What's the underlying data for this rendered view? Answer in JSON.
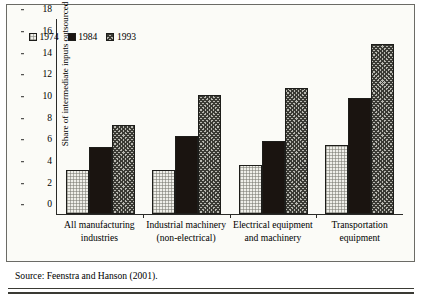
{
  "chart_data": {
    "type": "bar",
    "title": "",
    "subtitle": "",
    "xlabel": "",
    "ylabel": "Share of intermediate inputs outsourced",
    "ylim": [
      0,
      18
    ],
    "yticks": [
      0,
      2,
      4,
      6,
      8,
      10,
      12,
      14,
      16,
      18
    ],
    "grid": false,
    "legend_position": "top-left",
    "categories": [
      "All manufacturing industries",
      "Industrial machinery (non-electrical)",
      "Electrical equipment and machinery",
      "Transportation equipment"
    ],
    "series": [
      {
        "name": "1974",
        "values": [
          4.1,
          4.1,
          4.5,
          6.4
        ]
      },
      {
        "name": "1984",
        "values": [
          6.2,
          7.2,
          6.7,
          10.7
        ]
      },
      {
        "name": "1993",
        "values": [
          8.2,
          11.0,
          11.6,
          15.7
        ]
      }
    ],
    "series_colors": [
      "#efefe9",
      "#1a1410",
      "#b9b9b2"
    ],
    "series_patterns": [
      "dotted-light",
      "solid-black",
      "crosshatch-gray"
    ]
  },
  "legend": {
    "items": [
      {
        "label": "1974",
        "swatch": "legend-swatch-1974"
      },
      {
        "label": "1984",
        "swatch": "legend-swatch-1984"
      },
      {
        "label": "1993",
        "swatch": "legend-swatch-1993"
      }
    ]
  },
  "axis": {
    "y_title": "Share of intermediate inputs outsourced",
    "y_ticks": [
      "18",
      "16",
      "14",
      "12",
      "10",
      "8",
      "6",
      "4",
      "2",
      "0"
    ],
    "x_labels": [
      "All manufacturing industries",
      "Industrial machinery (non-electrical)",
      "Electrical equipment and machinery",
      "Transportation equipment"
    ]
  },
  "footer": {
    "source": "Source: Feenstra and Hanson (2001)."
  }
}
